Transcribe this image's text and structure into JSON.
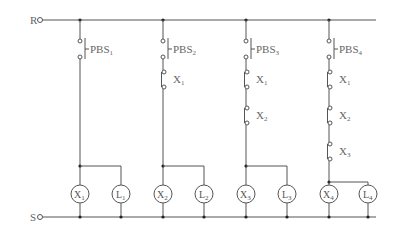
{
  "rails": {
    "top": {
      "label": "R",
      "y": 20,
      "x_start": 42,
      "x_end": 376
    },
    "bottom": {
      "label": "S",
      "y": 217,
      "x_start": 42,
      "x_end": 376
    }
  },
  "columns": [
    {
      "x": 80,
      "pbs": {
        "label": "PBS",
        "sub": "1"
      },
      "interlocks": [],
      "node_y": 166,
      "coil": {
        "label": "X",
        "sub": "1"
      },
      "lamp": {
        "label": "L",
        "sub": "1",
        "x": 121
      }
    },
    {
      "x": 163,
      "pbs": {
        "label": "PBS",
        "sub": "2"
      },
      "interlocks": [
        {
          "label": "X",
          "sub": "1"
        }
      ],
      "node_y": 166,
      "coil": {
        "label": "X",
        "sub": "2"
      },
      "lamp": {
        "label": "L",
        "sub": "2",
        "x": 204
      }
    },
    {
      "x": 246,
      "pbs": {
        "label": "PBS",
        "sub": "3"
      },
      "interlocks": [
        {
          "label": "X",
          "sub": "1"
        },
        {
          "label": "X",
          "sub": "2"
        }
      ],
      "node_y": 166,
      "coil": {
        "label": "X",
        "sub": "3"
      },
      "lamp": {
        "label": "L",
        "sub": "3",
        "x": 287
      }
    },
    {
      "x": 329,
      "pbs": {
        "label": "PBS",
        "sub": "4"
      },
      "interlocks": [
        {
          "label": "X",
          "sub": "1"
        },
        {
          "label": "X",
          "sub": "2"
        },
        {
          "label": "X",
          "sub": "3"
        }
      ],
      "node_y": 182,
      "coil": {
        "label": "X",
        "sub": "4"
      },
      "lamp": {
        "label": "L",
        "sub": "4",
        "x": 368
      }
    }
  ],
  "coil_y": 194,
  "coil_r": 9
}
